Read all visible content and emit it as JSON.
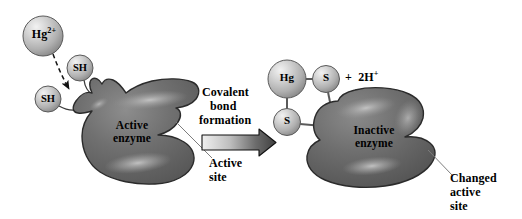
{
  "figure": {
    "kind": "biochemistry-mechanism-diagram",
    "background_color": "#ffffff",
    "palette": {
      "enzyme_fill": "#6e6e6e",
      "enzyme_highlight": "#a8a8a8",
      "enzyme_shadow": "#4a4a4a",
      "enzyme_outline": "#2b2b2b",
      "sphere_fill": "#b9b9b9",
      "sphere_highlight": "#ededed",
      "sphere_shadow": "#777777",
      "sphere_outline": "#555555",
      "bond_line": "#555555",
      "text_color": "#000000",
      "leader_line": "#777777",
      "arrow_light": "#e8e8e8",
      "arrow_dark": "#4f4f4f",
      "arrow_outline": "#111111"
    }
  },
  "left_panel": {
    "name": "active-enzyme-panel",
    "enzyme_label_line1": "Active",
    "enzyme_label_line2": "enzyme",
    "annotation": {
      "line1": "Active",
      "line2": "site"
    },
    "spheres": [
      {
        "id": "mercury-ion",
        "label": "Hg",
        "charge": "2+",
        "cx": 43,
        "cy": 36,
        "r": 20
      },
      {
        "id": "thiol-upper",
        "label": "SH",
        "cx": 80,
        "cy": 68,
        "r": 13
      },
      {
        "id": "thiol-lower",
        "label": "SH",
        "cx": 48,
        "cy": 99,
        "r": 13
      }
    ],
    "reaction_arrow": {
      "id": "binding-arrow",
      "style": "dashed",
      "from": [
        52,
        52
      ],
      "to": [
        71,
        92
      ]
    }
  },
  "process_arrow": {
    "name": "covalent-bond-formation-arrow",
    "line1": "Covalent",
    "line2": "bond",
    "line3": "formation",
    "direction": "right"
  },
  "right_panel": {
    "name": "inactive-enzyme-panel",
    "enzyme_label_line1": "Inactive",
    "enzyme_label_line2": "enzyme",
    "annotation": {
      "line1": "Changed",
      "line2": "active",
      "line3": "site"
    },
    "byproduct": "+  2H",
    "byproduct_charge": "+",
    "spheres": [
      {
        "id": "mercury-atom",
        "label": "Hg",
        "cx": 287,
        "cy": 79,
        "r": 19
      },
      {
        "id": "sulfur-upper",
        "label": "S",
        "cx": 326,
        "cy": 79,
        "r": 13.5
      },
      {
        "id": "sulfur-lower",
        "label": "S",
        "cx": 287,
        "cy": 122,
        "r": 13.5
      }
    ],
    "bonds": [
      {
        "id": "hg-s-upper-bond",
        "from": "mercury-atom",
        "to": "sulfur-upper"
      },
      {
        "id": "hg-s-lower-bond",
        "from": "mercury-atom",
        "to": "sulfur-lower"
      },
      {
        "id": "s-upper-enzyme-bond",
        "from": "sulfur-upper",
        "to": "enzyme"
      },
      {
        "id": "s-lower-enzyme-bond",
        "from": "sulfur-lower",
        "to": "enzyme"
      }
    ]
  }
}
